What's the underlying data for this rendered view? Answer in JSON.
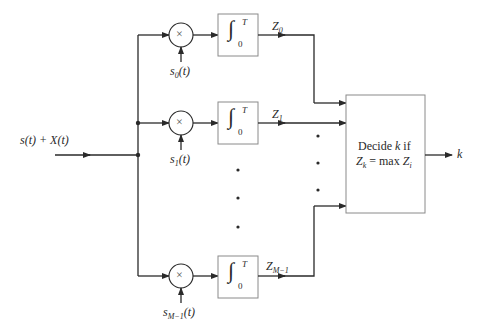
{
  "diagram": {
    "type": "block-diagram",
    "title": "",
    "input": {
      "label": "s(t) + X(t)"
    },
    "branches": [
      {
        "id": "0",
        "reference": "s_0(t)",
        "reference_base": "s",
        "reference_sub": "0",
        "reference_arg": "(t)",
        "multiplier_symbol": "×",
        "integrator": {
          "lower": "0",
          "upper": "T"
        },
        "output": "Z_0",
        "output_base": "Z",
        "output_sub": "0"
      },
      {
        "id": "1",
        "reference": "s_1(t)",
        "reference_base": "s",
        "reference_sub": "1",
        "reference_arg": "(t)",
        "multiplier_symbol": "×",
        "integrator": {
          "lower": "0",
          "upper": "T"
        },
        "output": "Z_1",
        "output_base": "Z",
        "output_sub": "1"
      },
      {
        "id": "M-1",
        "reference": "s_{M-1}(t)",
        "reference_base": "s",
        "reference_sub": "M−1",
        "reference_arg": "(t)",
        "multiplier_symbol": "×",
        "integrator": {
          "lower": "0",
          "upper": "T"
        },
        "output": "Z_{M-1}",
        "output_base": "Z",
        "output_sub": "M−1"
      }
    ],
    "ellipsis": "⋮",
    "decision": {
      "line1_pre": "Decide ",
      "line1_var": "k",
      "line1_post": " if",
      "line2_z": "Z",
      "line2_sub": "k",
      "line2_mid": " = max ",
      "line2_z2": "Z",
      "line2_sub2": "i"
    },
    "output": {
      "label": "k"
    },
    "colors": {
      "line": "#2a2a2a",
      "box_border": "#8a8a8a",
      "text": "#2a2a2a"
    }
  }
}
